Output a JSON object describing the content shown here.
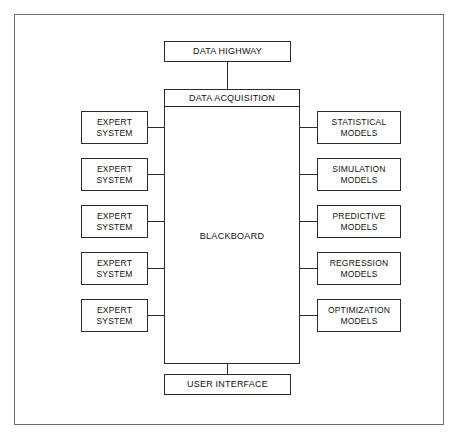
{
  "diagram": {
    "title_top": "DATA HIGHWAY",
    "center_header": "DATA ACQUISITION",
    "center_label": "BLACKBOARD",
    "title_bottom": "USER INTERFACE",
    "left_nodes": [
      {
        "label": "EXPERT\nSYSTEM"
      },
      {
        "label": "EXPERT\nSYSTEM"
      },
      {
        "label": "EXPERT\nSYSTEM"
      },
      {
        "label": "EXPERT\nSYSTEM"
      },
      {
        "label": "EXPERT\nSYSTEM"
      }
    ],
    "right_nodes": [
      {
        "label": "STATISTICAL\nMODELS"
      },
      {
        "label": "SIMULATION\nMODELS"
      },
      {
        "label": "PREDICTIVE\nMODELS"
      },
      {
        "label": "REGRESSION\nMODELS"
      },
      {
        "label": "OPTIMIZATION\nMODELS"
      }
    ],
    "colors": {
      "frame": "#6e6e72",
      "box_border": "#2b2b2b",
      "text": "#111111",
      "background": "#ffffff"
    }
  }
}
